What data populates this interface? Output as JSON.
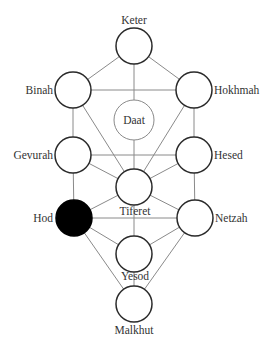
{
  "diagram": {
    "title": "",
    "colors": {
      "edge": "#8a8a8a",
      "node_stroke": "#2a2a2a",
      "node_fill": "#ffffff",
      "highlight_fill": "#000000",
      "text": "#333333"
    },
    "nodes": [
      {
        "id": "keter",
        "label": "Keter",
        "cx": 134,
        "cy": 46,
        "r": 18,
        "filled": false
      },
      {
        "id": "binah",
        "label": "Binah",
        "cx": 73,
        "cy": 90,
        "r": 18,
        "filled": false
      },
      {
        "id": "hokhmah",
        "label": "Hokhmah",
        "cx": 194,
        "cy": 90,
        "r": 18,
        "filled": false
      },
      {
        "id": "daat",
        "label": "Daat",
        "cx": 134,
        "cy": 120,
        "r": 20,
        "filled": false
      },
      {
        "id": "gevurah",
        "label": "Gevurah",
        "cx": 73,
        "cy": 155,
        "r": 18,
        "filled": false
      },
      {
        "id": "hesed",
        "label": "Hesed",
        "cx": 194,
        "cy": 155,
        "r": 18,
        "filled": false
      },
      {
        "id": "tiferet",
        "label": "Tiferet",
        "cx": 134,
        "cy": 187,
        "r": 18,
        "filled": false
      },
      {
        "id": "hod",
        "label": "Hod",
        "cx": 74,
        "cy": 218,
        "r": 18,
        "filled": true
      },
      {
        "id": "netzah",
        "label": "Netzah",
        "cx": 195,
        "cy": 218,
        "r": 18,
        "filled": false
      },
      {
        "id": "yesod",
        "label": "Yesod",
        "cx": 134,
        "cy": 254,
        "r": 18,
        "filled": false
      },
      {
        "id": "malkhut",
        "label": "Malkhut",
        "cx": 134,
        "cy": 304,
        "r": 18,
        "filled": false
      }
    ],
    "edges": [
      [
        "keter",
        "binah"
      ],
      [
        "keter",
        "hokhmah"
      ],
      [
        "keter",
        "tiferet"
      ],
      [
        "binah",
        "hokhmah"
      ],
      [
        "binah",
        "gevurah"
      ],
      [
        "binah",
        "tiferet"
      ],
      [
        "hokhmah",
        "hesed"
      ],
      [
        "hokhmah",
        "tiferet"
      ],
      [
        "gevurah",
        "hesed"
      ],
      [
        "gevurah",
        "tiferet"
      ],
      [
        "hesed",
        "tiferet"
      ],
      [
        "gevurah",
        "hod"
      ],
      [
        "hesed",
        "netzah"
      ],
      [
        "hod",
        "tiferet"
      ],
      [
        "netzah",
        "tiferet"
      ],
      [
        "hod",
        "netzah"
      ],
      [
        "tiferet",
        "yesod"
      ],
      [
        "hod",
        "yesod"
      ],
      [
        "netzah",
        "yesod"
      ],
      [
        "hod",
        "malkhut"
      ],
      [
        "netzah",
        "malkhut"
      ],
      [
        "yesod",
        "malkhut"
      ]
    ],
    "labels": {
      "keter": "Keter",
      "binah": "Binah",
      "hokhmah": "Hokhmah",
      "daat": "Daat",
      "gevurah": "Gevurah",
      "hesed": "Hesed",
      "tiferet": "Tiferet",
      "hod": "Hod",
      "netzah": "Netzah",
      "yesod": "Yesod",
      "malkhut": "Malkhut"
    }
  }
}
